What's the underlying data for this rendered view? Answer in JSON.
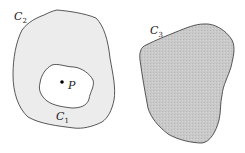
{
  "diagram": {
    "regions": [
      {
        "id": "C2",
        "label": "C",
        "subscript": "2",
        "fill": "#ececec",
        "stroke": "#444444",
        "description": "outer closed curve, lightly shaded"
      },
      {
        "id": "C1",
        "label": "C",
        "subscript": "1",
        "fill": "#ffffff",
        "stroke": "#444444",
        "description": "inner closed curve inside C2, unshaded"
      },
      {
        "id": "C3",
        "label": "C",
        "subscript": "3",
        "fill": "#c8c8c8",
        "stroke": "#444444",
        "description": "separate closed curve, darker shaded"
      }
    ],
    "point": {
      "label": "P",
      "color": "#000000"
    }
  }
}
